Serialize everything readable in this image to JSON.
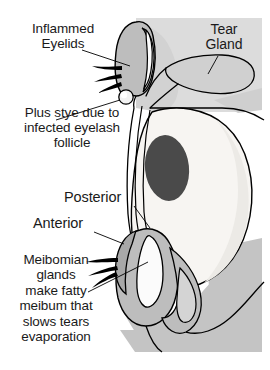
{
  "figure": {
    "background_color": "#ffffff"
  },
  "labels": {
    "inflamed_eyelids": "Inflammed\nEyelids",
    "stye_note": "Plus stye due to\ninfected eyelash\nfollicle",
    "tear_gland": "Tear\nGland",
    "posterior": "Posterior",
    "anterior": "Anterior",
    "meibomian_note": "Meibomian\nglands\nmake fatty\nmeibum that\nslows tears\nevaporation"
  },
  "colors": {
    "text": "#1a1a1a",
    "outline": "#000000",
    "orbit_light": "#dcdcdc",
    "orbit_mid": "#c4c4c4",
    "orbit_dark": "#b0b0b0",
    "eyeball_white": "#f7f5f2",
    "pupil": "#4a4a4a",
    "lid_shade": "#b8b8b8",
    "gland_fill": "#d4d4d4",
    "stye": "#f2f2f2",
    "lash": "#000000"
  },
  "structures": [
    {
      "name": "orbital-tissue-block",
      "description": "light gray soft-tissue background block behind the eye"
    },
    {
      "name": "tear-gland",
      "description": "lobed lacrimal gland above and lateral to the eyeball"
    },
    {
      "name": "eyeball",
      "description": "large pale oval globe of the eye"
    },
    {
      "name": "pupil",
      "description": "dark ellipse on the front of the globe"
    },
    {
      "name": "upper-eyelid",
      "description": "upper lid with inflamed margin and eyelashes"
    },
    {
      "name": "lower-eyelid",
      "description": "lower lid bulb containing Meibomian glands"
    },
    {
      "name": "stye",
      "description": "small pale nodule at the upper lash line"
    },
    {
      "name": "meibomian-gland-upper",
      "description": "elongated gland within the upper lid"
    },
    {
      "name": "meibomian-gland-lower",
      "description": "elongated gland within the lower lid"
    },
    {
      "name": "eyelashes-upper",
      "description": "three black lashes from the upper lid"
    },
    {
      "name": "eyelashes-lower",
      "description": "three black lashes from the lower lid"
    }
  ],
  "leader_lines": [
    {
      "name": "leader-inflamed-eyelids",
      "from": "Inflammed Eyelids",
      "to": "upper lid margin"
    },
    {
      "name": "leader-stye",
      "from": "Plus stye due to infected eyelash follicle",
      "to": "stye nodule"
    },
    {
      "name": "leader-tear-gland",
      "from": "Tear Gland",
      "to": "lacrimal gland body"
    },
    {
      "name": "leader-posterior",
      "from": "Posterior",
      "to": "posterior lid margin"
    },
    {
      "name": "leader-anterior",
      "from": "Anterior",
      "to": "anterior lid margin"
    },
    {
      "name": "leader-meibomian",
      "from": "Meibomian glands",
      "to": "lower lid gland"
    }
  ]
}
